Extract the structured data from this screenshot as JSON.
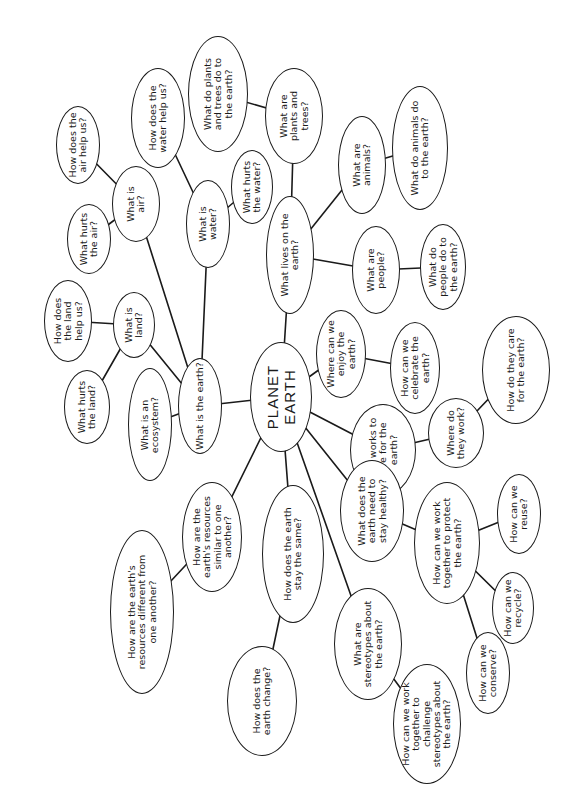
{
  "diagram": {
    "type": "mind-map",
    "orientation": "rotated-90-ccw",
    "line_color": "#1a1a1a",
    "background": "#ffffff",
    "center": {
      "id": "planet-earth",
      "label": "PLANET EARTH",
      "box": [
        250,
        342,
        62,
        110
      ]
    },
    "nodes": [
      {
        "id": "earth",
        "label": "What is the earth?",
        "parent": "planet-earth",
        "box": [
          178,
          358,
          44,
          96
        ],
        "w": 92
      },
      {
        "id": "ecosystem",
        "label": "What is an ecosystem?",
        "parent": "earth",
        "box": [
          128,
          368,
          44,
          113
        ],
        "w": 100
      },
      {
        "id": "land",
        "label": "What is land?",
        "parent": "earth",
        "box": [
          113,
          292,
          42,
          66
        ],
        "w": 56
      },
      {
        "id": "land-help",
        "label": "How does the land help us?",
        "parent": "land",
        "box": [
          44,
          280,
          48,
          82
        ],
        "w": 62
      },
      {
        "id": "land-hurt",
        "label": "What hurts the land?",
        "parent": "land",
        "box": [
          64,
          370,
          46,
          74
        ],
        "w": 62
      },
      {
        "id": "air",
        "label": "What is air?",
        "parent": "earth",
        "box": [
          112,
          166,
          48,
          76
        ],
        "w": 50
      },
      {
        "id": "air-help",
        "label": "How does the air help us?",
        "parent": "air",
        "box": [
          56,
          106,
          44,
          78
        ],
        "w": 72
      },
      {
        "id": "air-hurt",
        "label": "What hurts the air?",
        "parent": "air",
        "box": [
          67,
          204,
          44,
          70
        ],
        "w": 56
      },
      {
        "id": "water",
        "label": "What is water?",
        "parent": "earth",
        "box": [
          186,
          180,
          44,
          88
        ],
        "w": 66
      },
      {
        "id": "water-help",
        "label": "How does the water help us?",
        "parent": "water",
        "box": [
          131,
          68,
          54,
          100
        ],
        "w": 80
      },
      {
        "id": "water-hurt",
        "label": "What hurts the water?",
        "parent": "water",
        "box": [
          231,
          150,
          42,
          74
        ],
        "w": 56
      },
      {
        "id": "lives",
        "label": "What lives on the earth?",
        "parent": "planet-earth",
        "box": [
          266,
          196,
          48,
          118
        ],
        "w": 96
      },
      {
        "id": "plants",
        "label": "What are plants and trees?",
        "parent": "lives",
        "box": [
          265,
          68,
          58,
          96
        ],
        "w": 74
      },
      {
        "id": "plants-do",
        "label": "What do plants and trees do to the earth?",
        "parent": "plants",
        "box": [
          188,
          36,
          60,
          116
        ],
        "w": 90
      },
      {
        "id": "animals",
        "label": "What are animals?",
        "parent": "lives",
        "box": [
          338,
          116,
          48,
          98
        ],
        "w": 76
      },
      {
        "id": "animals-do",
        "label": "What do animals do to the earth?",
        "parent": "animals",
        "box": [
          392,
          86,
          56,
          124
        ],
        "w": 96
      },
      {
        "id": "people",
        "label": "What are people?",
        "parent": "lives",
        "box": [
          352,
          226,
          48,
          88
        ],
        "w": 68
      },
      {
        "id": "people-do",
        "label": "What do people do to the earth?",
        "parent": "people",
        "box": [
          420,
          224,
          46,
          86
        ],
        "w": 70
      },
      {
        "id": "enjoy",
        "label": "Where can we enjoy the earth?",
        "parent": "planet-earth",
        "box": [
          316,
          310,
          50,
          88
        ],
        "w": 70
      },
      {
        "id": "celebrate",
        "label": "How can we celebrate the earth?",
        "parent": "enjoy",
        "box": [
          390,
          322,
          50,
          92
        ],
        "w": 72
      },
      {
        "id": "who-works",
        "label": "Who works to care for the earth?",
        "parent": "planet-earth",
        "box": [
          350,
          404,
          66,
          92
        ],
        "w": 74
      },
      {
        "id": "where-work",
        "label": "Where do they work?",
        "parent": "who-works",
        "box": [
          428,
          398,
          56,
          70
        ],
        "w": 54
      },
      {
        "id": "how-care",
        "label": "How do they care for the earth?",
        "parent": "where-work",
        "box": [
          482,
          316,
          68,
          108
        ],
        "w": 84
      },
      {
        "id": "healthy",
        "label": "What does the earth need to stay healthy?",
        "parent": "planet-earth",
        "box": [
          340,
          460,
          64,
          102
        ],
        "w": 82
      },
      {
        "id": "protect",
        "label": "How can we work together to protect the earth?",
        "parent": "healthy",
        "box": [
          414,
          482,
          66,
          122
        ],
        "w": 100
      },
      {
        "id": "reuse",
        "label": "How can we reuse?",
        "parent": "protect",
        "box": [
          497,
          474,
          44,
          80
        ],
        "w": 62
      },
      {
        "id": "recycle",
        "label": "How can we recycle?",
        "parent": "protect",
        "box": [
          492,
          572,
          42,
          72
        ],
        "w": 58
      },
      {
        "id": "conserve",
        "label": "How can we conserve?",
        "parent": "protect",
        "box": [
          466,
          632,
          44,
          82
        ],
        "w": 64
      },
      {
        "id": "stereotypes",
        "label": "What are stereotypes about the earth?",
        "parent": "planet-earth",
        "box": [
          334,
          588,
          68,
          112
        ],
        "w": 88
      },
      {
        "id": "challenge",
        "label": "How can we work together to challenge stereotypes about the earth?",
        "parent": "stereotypes",
        "box": [
          393,
          664,
          68,
          120
        ],
        "w": 100
      },
      {
        "id": "stay-same",
        "label": "How does the earth stay the same?",
        "parent": "planet-earth",
        "box": [
          262,
          485,
          62,
          138
        ],
        "w": 110
      },
      {
        "id": "change",
        "label": "How does the earth change?",
        "parent": "stay-same",
        "box": [
          227,
          646,
          70,
          110
        ],
        "w": 84
      },
      {
        "id": "similar",
        "label": "How are the earth's resources similar to one another?",
        "parent": "planet-earth",
        "box": [
          182,
          482,
          60,
          110
        ],
        "w": 90
      },
      {
        "id": "different",
        "label": "How are the earth's resources different from one another?",
        "parent": "similar",
        "box": [
          110,
          530,
          64,
          164
        ],
        "w": 130
      }
    ]
  }
}
